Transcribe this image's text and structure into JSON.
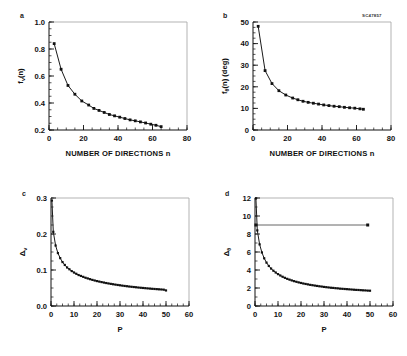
{
  "figure": {
    "stamp": "SC47857",
    "panel_letters": [
      "a",
      "b",
      "c",
      "d"
    ]
  },
  "chart_data": [
    {
      "type": "line",
      "panel": "a",
      "title": "",
      "xlabel": "NUMBER OF DIRECTIONS n",
      "ylabel": "f_v(n)",
      "ylabel_base": "f",
      "ylabel_sub": "v",
      "ylabel_rest": "(n)",
      "xlim": [
        0,
        80
      ],
      "ylim": [
        0.2,
        1.0
      ],
      "xticks": [
        0,
        20,
        40,
        60,
        80
      ],
      "xticklabels": [
        "0",
        "20",
        "40",
        "60",
        "80"
      ],
      "yticks": [
        0.2,
        0.4,
        0.6,
        0.8,
        1.0
      ],
      "yticklabels": [
        "0.2",
        "0.4",
        "0.6",
        "0.8",
        "1.0"
      ],
      "xminor_step": 5,
      "yminor_step": 0.05,
      "grid": false,
      "marker": "square",
      "x": [
        3,
        7,
        11,
        15,
        19,
        23,
        26,
        29,
        32,
        35,
        38,
        41,
        44,
        47,
        50,
        53,
        56,
        59,
        62,
        65
      ],
      "y": [
        0.84,
        0.65,
        0.53,
        0.465,
        0.415,
        0.385,
        0.36,
        0.345,
        0.33,
        0.315,
        0.305,
        0.295,
        0.285,
        0.275,
        0.268,
        0.26,
        0.252,
        0.243,
        0.235,
        0.225
      ]
    },
    {
      "type": "line",
      "panel": "b",
      "title": "",
      "xlabel": "NUMBER OF DIRECTIONS n",
      "ylabel": "f_theta(n) (deg)",
      "ylabel_base": "f",
      "ylabel_sub": "θ",
      "ylabel_rest": "(n) (deg)",
      "xlim": [
        0,
        80
      ],
      "ylim": [
        0,
        50
      ],
      "xticks": [
        0,
        20,
        40,
        60,
        80
      ],
      "xticklabels": [
        "0",
        "20",
        "40",
        "60",
        "80"
      ],
      "yticks": [
        0,
        10,
        20,
        30,
        40,
        50
      ],
      "yticklabels": [
        "0",
        "10",
        "20",
        "30",
        "40",
        "50"
      ],
      "xminor_step": 5,
      "yminor_step": 2.5,
      "grid": false,
      "marker": "square",
      "x": [
        3,
        7,
        11,
        15,
        19,
        23,
        26,
        29,
        32,
        35,
        38,
        41,
        44,
        47,
        50,
        53,
        56,
        59,
        62,
        64
      ],
      "y": [
        48.0,
        27.5,
        21.5,
        18.2,
        16.2,
        14.8,
        14.0,
        13.3,
        12.8,
        12.4,
        12.0,
        11.6,
        11.3,
        11.0,
        10.8,
        10.5,
        10.3,
        10.1,
        9.8,
        9.6
      ]
    },
    {
      "type": "line",
      "panel": "c",
      "title": "",
      "xlabel": "P",
      "ylabel": "Δ_v",
      "ylabel_base": "Δ",
      "ylabel_sub": "v",
      "ylabel_rest": "",
      "xlim": [
        0,
        60
      ],
      "ylim": [
        0.0,
        0.3
      ],
      "xticks": [
        0,
        10,
        20,
        30,
        40,
        50,
        60
      ],
      "xticklabels": [
        "0",
        "10",
        "20",
        "30",
        "40",
        "50",
        "60"
      ],
      "yticks": [
        0.0,
        0.1,
        0.2,
        0.3
      ],
      "yticklabels": [
        "0.0",
        "0.1",
        "0.2",
        "0.3"
      ],
      "xminor_step": 2.5,
      "yminor_step": 0.025,
      "grid": false,
      "marker": "square",
      "x": [
        0.4,
        1.0,
        2.0,
        3.0,
        4.0,
        5.0,
        6.0,
        7.0,
        8.0,
        9.0,
        10.0,
        11.0,
        12.0,
        13.0,
        14.0,
        15.0,
        16.0,
        17.0,
        18.0,
        19.0,
        20.0,
        21.0,
        22.0,
        23.0,
        24.0,
        25.0,
        26.0,
        27.0,
        28.0,
        29.0,
        30.0,
        31.0,
        32.0,
        33.0,
        34.0,
        35.0,
        36.0,
        37.0,
        38.0,
        39.0,
        40.0,
        41.0,
        42.0,
        43.0,
        44.0,
        45.0,
        46.0,
        47.0,
        48.0,
        49.0,
        50.0
      ],
      "y": [
        0.293,
        0.206,
        0.168,
        0.147,
        0.133,
        0.122,
        0.114,
        0.107,
        0.102,
        0.097,
        0.093,
        0.0895,
        0.086,
        0.0835,
        0.081,
        0.0785,
        0.0765,
        0.0745,
        0.0725,
        0.0708,
        0.0692,
        0.0678,
        0.0664,
        0.0651,
        0.0638,
        0.0626,
        0.0615,
        0.0604,
        0.0594,
        0.0584,
        0.0575,
        0.0566,
        0.0557,
        0.0549,
        0.0541,
        0.0534,
        0.0527,
        0.052,
        0.0513,
        0.0507,
        0.0501,
        0.0495,
        0.0489,
        0.0484,
        0.0478,
        0.0473,
        0.0468,
        0.0463,
        0.0459,
        0.0454,
        0.0432
      ]
    },
    {
      "type": "line",
      "panel": "d",
      "title": "",
      "xlabel": "P",
      "ylabel": "Δ_theta",
      "ylabel_base": "Δ",
      "ylabel_sub": "θ",
      "ylabel_rest": "",
      "xlim": [
        0,
        60
      ],
      "ylim": [
        0,
        12
      ],
      "xticks": [
        0,
        10,
        20,
        30,
        40,
        50,
        60
      ],
      "xticklabels": [
        "0",
        "10",
        "20",
        "30",
        "40",
        "50",
        "60"
      ],
      "yticks": [
        0,
        2,
        4,
        6,
        8,
        10,
        12
      ],
      "yticklabels": [
        "0",
        "2",
        "4",
        "6",
        "8",
        "10",
        "12"
      ],
      "xminor_step": 2.5,
      "yminor_step": 1,
      "grid": false,
      "marker": "square",
      "reference_line": {
        "y": 9.0,
        "x_start": 0.4,
        "x_end": 49.0,
        "label": ""
      },
      "x": [
        0.4,
        1.0,
        2.0,
        3.0,
        4.0,
        5.0,
        6.0,
        7.0,
        8.0,
        9.0,
        10.0,
        11.0,
        12.0,
        13.0,
        14.0,
        15.0,
        16.0,
        17.0,
        18.0,
        19.0,
        20.0,
        21.0,
        22.0,
        23.0,
        24.0,
        25.0,
        26.0,
        27.0,
        28.0,
        29.0,
        30.0,
        31.0,
        32.0,
        33.0,
        34.0,
        35.0,
        36.0,
        37.0,
        38.0,
        39.0,
        40.0,
        41.0,
        42.0,
        43.0,
        44.0,
        45.0,
        46.0,
        47.0,
        48.0,
        49.0,
        50.0
      ],
      "y": [
        11.95,
        8.4,
        6.85,
        5.95,
        5.3,
        4.82,
        4.45,
        4.16,
        3.92,
        3.72,
        3.54,
        3.39,
        3.25,
        3.13,
        3.02,
        2.93,
        2.84,
        2.76,
        2.69,
        2.62,
        2.56,
        2.5,
        2.45,
        2.4,
        2.35,
        2.31,
        2.27,
        2.23,
        2.19,
        2.16,
        2.12,
        2.09,
        2.06,
        2.03,
        2.01,
        1.98,
        1.96,
        1.93,
        1.91,
        1.89,
        1.87,
        1.85,
        1.83,
        1.81,
        1.79,
        1.78,
        1.76,
        1.74,
        1.73,
        1.71,
        1.7
      ]
    }
  ]
}
